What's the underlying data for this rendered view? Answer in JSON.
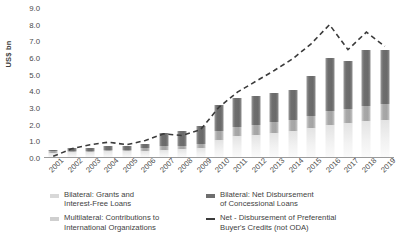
{
  "chart_data": {
    "type": "bar",
    "title": "",
    "xlabel": "",
    "ylabel": "US$ bn",
    "ylim": [
      0.0,
      9.0
    ],
    "yticks": [
      "0.0",
      "1.0",
      "2.0",
      "3.0",
      "4.0",
      "5.0",
      "6.0",
      "7.0",
      "8.0",
      "9.0"
    ],
    "grid": false,
    "legend_position": "bottom",
    "stacked": true,
    "categories": [
      "2001",
      "2002",
      "2003",
      "2004",
      "2005",
      "2006",
      "2007",
      "2008",
      "2009",
      "2010",
      "2011",
      "2012",
      "2013",
      "2014",
      "2015",
      "2016",
      "2017",
      "2018",
      "2019"
    ],
    "series": [
      {
        "name": "Bilateral: Grants and Interest-Free Loans",
        "type": "bar",
        "color": "#d8d8d8",
        "values": [
          0.3,
          0.35,
          0.35,
          0.4,
          0.4,
          0.45,
          0.5,
          0.55,
          0.6,
          1.1,
          1.3,
          1.4,
          1.5,
          1.6,
          1.8,
          2.0,
          2.1,
          2.2,
          2.3
        ]
      },
      {
        "name": "Multilateral: Contributions to International Organizations",
        "type": "bar",
        "color": "#b4b4b4",
        "values": [
          0.1,
          0.1,
          0.1,
          0.1,
          0.1,
          0.15,
          0.2,
          0.2,
          0.25,
          0.5,
          0.55,
          0.6,
          0.65,
          0.7,
          0.75,
          0.8,
          0.85,
          0.9,
          0.95
        ]
      },
      {
        "name": "Bilateral: Net Disbursement of Concessional Loans",
        "type": "bar",
        "color": "#6e6e6e",
        "values": [
          0.1,
          0.15,
          0.15,
          0.2,
          0.2,
          0.25,
          0.8,
          0.85,
          1.05,
          1.6,
          1.75,
          1.7,
          1.75,
          1.8,
          2.35,
          3.2,
          2.85,
          3.4,
          3.25
        ]
      },
      {
        "name": "Net - Disbursement of Preferential Buyer's Credits (not ODA)",
        "type": "line",
        "style": "dashed",
        "color": "#3b3b3b",
        "values": [
          0.1,
          0.55,
          0.8,
          0.95,
          0.8,
          1.05,
          1.45,
          1.35,
          1.7,
          3.05,
          3.95,
          4.6,
          5.25,
          5.95,
          6.85,
          8.0,
          6.5,
          7.55,
          6.7
        ]
      }
    ]
  },
  "legend": {
    "items": [
      {
        "label": "Bilateral: Grants and\nInterest-Free Loans",
        "line1": "Bilateral: Grants and",
        "line2": "Interest-Free Loans"
      },
      {
        "label": "Bilateral: Net Disbursement\nof Concessional Loans",
        "line1": "Bilateral: Net Disbursement",
        "line2": "of Concessional Loans"
      },
      {
        "label": "Multilateral: Contributions to\nInternational Organizations",
        "line1": "Multilateral: Contributions to",
        "line2": "International Organizations"
      },
      {
        "label": "Net - Disbursement of Preferential\nBuyer's Credits (not ODA)",
        "line1": "Net - Disbursement of Preferential",
        "line2": "Buyer's Credits (not ODA)"
      }
    ]
  },
  "colors": {
    "grants": "#d8d8d8",
    "multilateral": "#b4b4b4",
    "concessional": "#6e6e6e",
    "buyers_credit_line": "#3b3b3b",
    "axis": "#9b9b9b",
    "text": "#3f3f3f"
  }
}
